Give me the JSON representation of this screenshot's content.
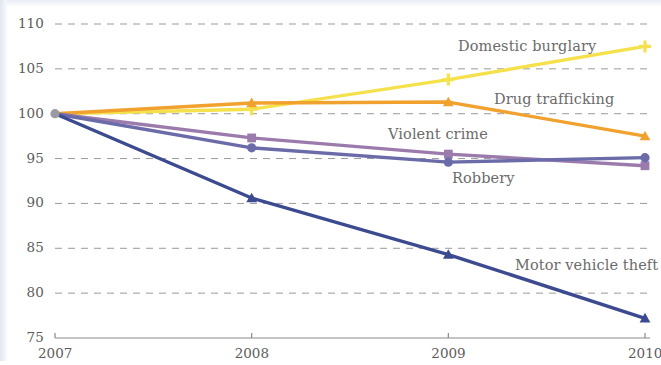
{
  "chart_data": {
    "type": "line",
    "title": "",
    "subtitle": "",
    "xlabel": "",
    "ylabel": "",
    "x": [
      "2007",
      "2008",
      "2009",
      "2010"
    ],
    "xtick_labels": [
      "2007",
      "2008",
      "2009",
      "2010"
    ],
    "ytick_labels": [
      "110",
      "105",
      "100",
      "95",
      "90",
      "85",
      "80",
      "75"
    ],
    "ytick_values": [
      110,
      105,
      100,
      95,
      90,
      85,
      80,
      75
    ],
    "ylim": [
      75,
      110
    ],
    "grid": "horizontal-dashed",
    "legend": "inline-labels",
    "series": [
      {
        "name": "Domestic burglary",
        "color": "#F5E14B",
        "marker": "plus",
        "values": [
          100,
          100.5,
          103.8,
          107.5
        ],
        "label_x": 458,
        "label_y": 38
      },
      {
        "name": "Drug trafficking",
        "color": "#F0A12E",
        "marker": "triangle",
        "values": [
          100,
          101.2,
          101.3,
          97.5
        ],
        "label_x": 494,
        "label_y": 91
      },
      {
        "name": "Violent crime",
        "color": "#9B7AAC",
        "marker": "square",
        "values": [
          100,
          97.3,
          95.5,
          94.2
        ],
        "label_x": 388,
        "label_y": 126
      },
      {
        "name": "Robbery",
        "color": "#6A6BA8",
        "marker": "circle",
        "values": [
          100,
          96.2,
          94.6,
          95.1
        ],
        "label_x": 452,
        "label_y": 170
      },
      {
        "name": "Motor vehicle theft",
        "color": "#3C4A8F",
        "marker": "triangle",
        "values": [
          100,
          90.6,
          84.3,
          77.2
        ],
        "label_x": 515,
        "label_y": 257
      }
    ],
    "origin_marker": {
      "color": "#9A9AA0",
      "marker": "circle",
      "x": "2007",
      "y": 100
    },
    "axis_color": "#8a8a8a",
    "gridline_color": "#9a9a9a"
  }
}
